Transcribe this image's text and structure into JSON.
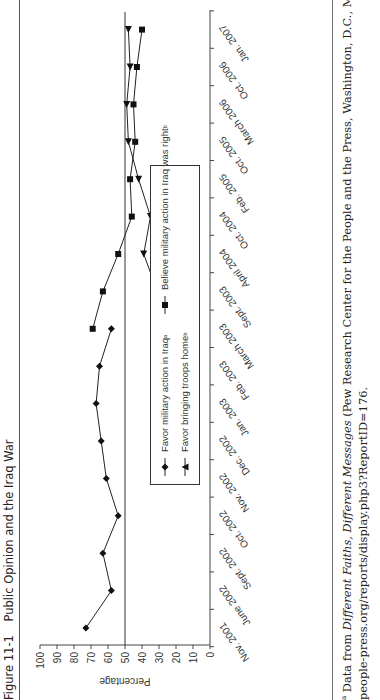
{
  "figure": {
    "number": "Figure 11-1",
    "title": "Public Opinion and the Iraq War"
  },
  "chart_data": {
    "type": "line",
    "title": "Public Opinion and the Iraq War",
    "xlabel": "",
    "ylabel": "Percentage",
    "ylim": [
      0,
      100
    ],
    "yticks": [
      0,
      10,
      20,
      30,
      40,
      50,
      60,
      70,
      80,
      90,
      100
    ],
    "reference_line": 50,
    "grid": false,
    "legend_position": "inside-bottom-center",
    "categories": [
      "Nov. 2001",
      "June 2002",
      "Sept. 2002",
      "Oct. 2002",
      "Nov. 2002",
      "Dec. 2002",
      "Jan. 2003",
      "Feb. 2003",
      "March 2003",
      "Sept. 2003",
      "April 2004",
      "Oct. 2004",
      "Feb. 2005",
      "Oct. 2005",
      "March 2006",
      "Oct. 2006",
      "Jan. 2007"
    ],
    "series": [
      {
        "name": "Favor military action in Iraq",
        "footnote": "a",
        "marker": "diamond",
        "values": [
          73,
          58,
          63,
          54,
          61,
          64,
          67,
          65,
          58,
          null,
          null,
          null,
          null,
          null,
          null,
          null,
          null
        ]
      },
      {
        "name": "Favor bringing troops home",
        "footnote": "b",
        "marker": "triangle",
        "values": [
          null,
          null,
          null,
          null,
          null,
          null,
          null,
          null,
          null,
          31,
          39,
          35,
          42,
          48,
          49,
          47,
          48
        ]
      },
      {
        "name": "Believe military action in Iraq was right",
        "footnote": "b",
        "marker": "square",
        "values": [
          null,
          null,
          null,
          null,
          null,
          null,
          null,
          null,
          69,
          63,
          54,
          46,
          47,
          44,
          45,
          43,
          40
        ]
      }
    ]
  },
  "footnotes": {
    "a_marker": "a",
    "a_prefix": " Data from ",
    "a_italic": "Different Faiths, Different Messages",
    "a_rest": " (Pew Research Center for the People and the Press, Washington, D.C., March 19, 2003), http://",
    "a_line2": "people-press.org/reports/display.php3?ReportID=176."
  }
}
